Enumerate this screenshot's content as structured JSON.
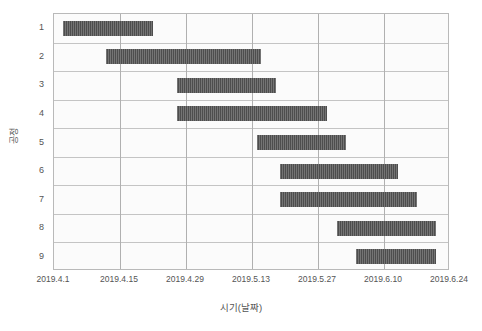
{
  "axes": {
    "x_title": "시기(날짜)",
    "y_title": "공정",
    "x_ticks": [
      "2019.4.1",
      "2019.4.15",
      "2019.4.29",
      "2019.5.13",
      "2019.5.27",
      "2019.6.10",
      "2019.6.24"
    ],
    "y_ticks": [
      "1",
      "2",
      "3",
      "4",
      "5",
      "6",
      "7",
      "8",
      "9"
    ]
  },
  "style": {
    "bar_color": "#4d4d4d",
    "grid_color": "#c4c4c4",
    "frame_color": "#b9b9b9",
    "plot_background": "#fbfbfb",
    "text_color": "#545454"
  },
  "chart_data": {
    "type": "bar",
    "subtype": "gantt",
    "title": "",
    "xlabel": "시기(날짜)",
    "ylabel": "공정",
    "grid": true,
    "legend": "none",
    "x_axis": {
      "start": "2019.4.1",
      "end": "2019.6.24",
      "tick_labels": [
        "2019.4.1",
        "2019.4.15",
        "2019.4.29",
        "2019.5.13",
        "2019.5.27",
        "2019.6.10",
        "2019.6.24"
      ],
      "tick_interval_days": 14,
      "total_days": 84
    },
    "y_axis": {
      "categories": [
        "1",
        "2",
        "3",
        "4",
        "5",
        "6",
        "7",
        "8",
        "9"
      ],
      "inverted": true
    },
    "categories": [
      "1",
      "2",
      "3",
      "4",
      "5",
      "6",
      "7",
      "8",
      "9"
    ],
    "tasks": [
      {
        "task": "1",
        "start_day": 2,
        "end_day": 21,
        "duration_days": 19,
        "start_date": "2019.4.3",
        "end_date": "2019.4.22"
      },
      {
        "task": "2",
        "start_day": 11,
        "end_day": 44,
        "duration_days": 33,
        "start_date": "2019.4.12",
        "end_date": "2019.5.15"
      },
      {
        "task": "3",
        "start_day": 26,
        "end_day": 47,
        "duration_days": 21,
        "start_date": "2019.4.27",
        "end_date": "2019.5.18"
      },
      {
        "task": "4",
        "start_day": 26,
        "end_day": 58,
        "duration_days": 32,
        "start_date": "2019.4.27",
        "end_date": "2019.5.29"
      },
      {
        "task": "5",
        "start_day": 43,
        "end_day": 62,
        "duration_days": 19,
        "start_date": "2019.5.14",
        "end_date": "2019.6.2"
      },
      {
        "task": "6",
        "start_day": 48,
        "end_day": 73,
        "duration_days": 25,
        "start_date": "2019.5.19",
        "end_date": "2019.6.13"
      },
      {
        "task": "7",
        "start_day": 48,
        "end_day": 77,
        "duration_days": 29,
        "start_date": "2019.5.19",
        "end_date": "2019.6.17"
      },
      {
        "task": "8",
        "start_day": 60,
        "end_day": 81,
        "duration_days": 21,
        "start_date": "2019.5.31",
        "end_date": "2019.6.21"
      },
      {
        "task": "9",
        "start_day": 64,
        "end_day": 81,
        "duration_days": 17,
        "start_date": "2019.6.4",
        "end_date": "2019.6.21"
      }
    ]
  }
}
